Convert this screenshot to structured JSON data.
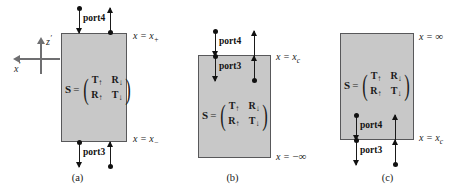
{
  "figure": {
    "colors": {
      "box_fill": "#c8c8c8",
      "box_border": "#58585a",
      "arrow": "#111111",
      "axis": "#6f6f71"
    },
    "matrix": {
      "lhs": "S",
      "equals": "=",
      "open_paren": "(",
      "close_paren": ")",
      "cells": [
        {
          "symbol": "T",
          "sub": "↑"
        },
        {
          "symbol": "R",
          "sub": "↓"
        },
        {
          "symbol": "R",
          "sub": "↑"
        },
        {
          "symbol": "T",
          "sub": "↓"
        }
      ]
    },
    "axes": {
      "vertical_label": "z",
      "vertical_prime": "′",
      "horizontal_label": "x",
      "horizontal_prime": "′"
    },
    "panels": [
      {
        "id": "a",
        "caption": "(a)",
        "top_label": {
          "var": "x",
          "eq": "=",
          "value": "x",
          "sub": "+"
        },
        "bottom_label": {
          "var": "x",
          "eq": "=",
          "value": "x",
          "sub": "−"
        },
        "ports": [
          {
            "name": "port4",
            "position": "top"
          },
          {
            "name": "port3",
            "position": "bottom"
          }
        ]
      },
      {
        "id": "b",
        "caption": "(b)",
        "top_label": {
          "var": "x",
          "eq": "=",
          "value": "x",
          "sub": "c"
        },
        "bottom_label": {
          "var": "x",
          "eq": "=",
          "value": "−∞",
          "sub": ""
        },
        "ports": [
          {
            "name": "port4",
            "position": "above-top"
          },
          {
            "name": "port3",
            "position": "below-top"
          }
        ]
      },
      {
        "id": "c",
        "caption": "(c)",
        "top_label": {
          "var": "x",
          "eq": "=",
          "value": "∞",
          "sub": ""
        },
        "bottom_label": {
          "var": "x",
          "eq": "=",
          "value": "x",
          "sub": "c"
        },
        "ports": [
          {
            "name": "port4",
            "position": "above-bottom"
          },
          {
            "name": "port3",
            "position": "below-bottom"
          }
        ]
      }
    ]
  }
}
